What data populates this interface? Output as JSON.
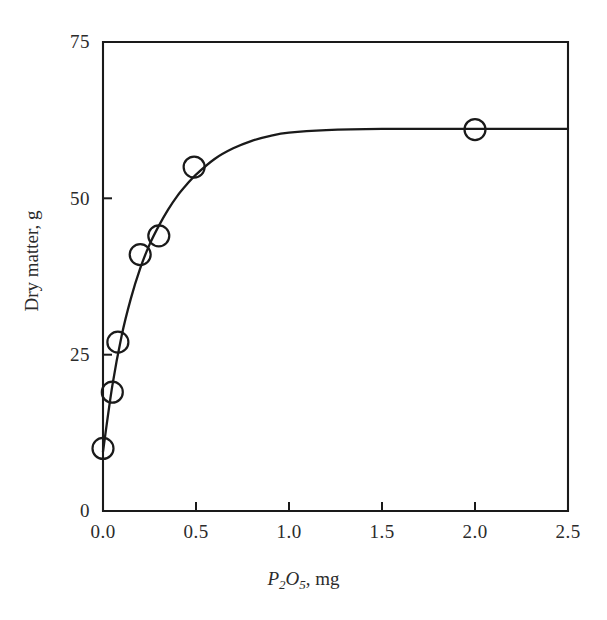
{
  "chart_data": {
    "type": "scatter",
    "title": "",
    "subtitle": "",
    "xlabel": "P2O5, mg",
    "xlabel_parts": {
      "lead": "P",
      "sub1": "2",
      "mid": "O",
      "sub2": "5",
      "tail": ", mg"
    },
    "ylabel": "Dry matter, g",
    "xlim": [
      0.0,
      2.5
    ],
    "ylim": [
      0,
      75
    ],
    "xticks": [
      0.0,
      0.5,
      1.0,
      1.5,
      2.0,
      2.5
    ],
    "xtick_labels": [
      "0.0",
      "0.5",
      "1.0",
      "1.5",
      "2.0",
      "2.5"
    ],
    "yticks": [
      0,
      25,
      50,
      75
    ],
    "ytick_labels": [
      "0",
      "25",
      "50",
      "75"
    ],
    "grid": false,
    "legend": false,
    "marker_style": "open-circle",
    "line_style": "smooth-fitted-curve",
    "series": [
      {
        "name": "Dry matter vs P2O5",
        "x": [
          0.0,
          0.05,
          0.08,
          0.2,
          0.3,
          0.49,
          2.0
        ],
        "values": [
          10,
          19,
          27,
          41,
          44,
          55,
          61
        ]
      }
    ],
    "fitted_curve": {
      "description": "Saturation curve rising steeply from 10 g at 0 mg to a plateau near 61 g beyond 1.0 mg",
      "x": [
        0.0,
        0.05,
        0.1,
        0.15,
        0.2,
        0.25,
        0.3,
        0.35,
        0.4,
        0.45,
        0.5,
        0.6,
        0.7,
        0.8,
        0.9,
        1.0,
        1.2,
        1.5,
        1.8,
        2.0,
        2.25,
        2.5
      ],
      "y": [
        9.5,
        20.0,
        28.0,
        34.0,
        38.8,
        42.6,
        45.6,
        48.2,
        50.4,
        52.2,
        53.8,
        56.3,
        58.0,
        59.2,
        60.0,
        60.5,
        60.9,
        61.1,
        61.1,
        61.1,
        61.1,
        61.1
      ]
    },
    "colors": {
      "axis": "#1a1a1a",
      "curve": "#1a1a1a",
      "marker_stroke": "#1a1a1a",
      "marker_fill": "#ffffff",
      "background": "#ffffff",
      "text": "#2b2b2b"
    }
  },
  "figure": {
    "plot_box": {
      "left": 103,
      "top": 42,
      "right": 568,
      "bottom": 511
    }
  }
}
